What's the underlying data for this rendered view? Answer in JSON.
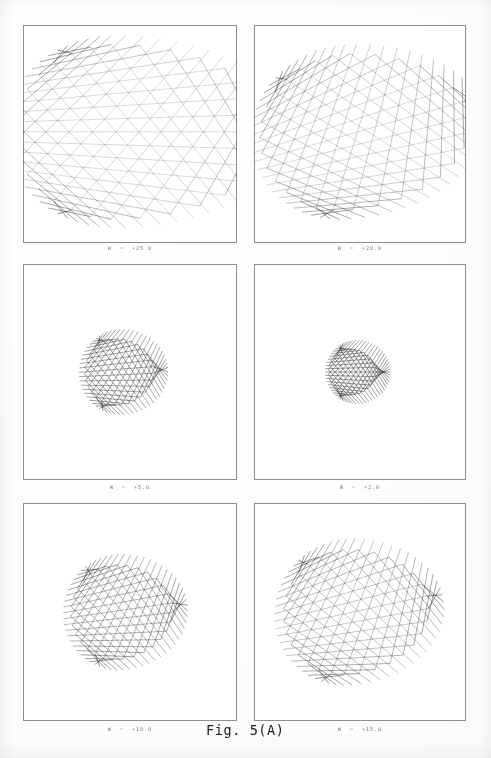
{
  "figure": {
    "caption": "Fig. 5(A)",
    "caption_x": 206,
    "caption_y": 722
  },
  "chart_data": {
    "type": "line",
    "title": "Fig. 5(A)",
    "xlabel": "",
    "ylabel": "",
    "grid": false,
    "legend": null,
    "panel_layout": {
      "rows": 3,
      "cols": 2
    },
    "ray_count_per_panel": 62,
    "panels": [
      {
        "index": 0,
        "label": "W  =  +25.0",
        "parameter_name": "W",
        "parameter_value": 25.0,
        "row": 0,
        "col": 0,
        "box": {
          "x": 23,
          "y": 25,
          "w": 214,
          "h": 218
        },
        "label_y": 245,
        "caustic": "three-cusped deltoid, wide open to the right, dense spine at left",
        "cusp_count": 3,
        "center": {
          "x": 0.44,
          "y": 0.49
        },
        "spread": 1.0,
        "twist": 0.0,
        "stretch": 1.62,
        "focus": 0.3
      },
      {
        "index": 1,
        "label": "W  =  +20.0",
        "parameter_name": "W",
        "parameter_value": 20.0,
        "row": 0,
        "col": 1,
        "box": {
          "x": 254,
          "y": 25,
          "w": 212,
          "h": 218
        },
        "label_y": 245,
        "caustic": "three-cusped caustic, arms rotated and swept clockwise, dense blob at left",
        "cusp_count": 3,
        "center": {
          "x": 0.44,
          "y": 0.49
        },
        "spread": 0.92,
        "twist": -0.3,
        "stretch": 1.4,
        "focus": 0.34
      },
      {
        "index": 2,
        "label": "W  =  +5.0",
        "parameter_name": "W",
        "parameter_value": 5.0,
        "row": 1,
        "col": 0,
        "box": {
          "x": 23,
          "y": 264,
          "w": 214,
          "h": 216
        },
        "label_y": 484,
        "caustic": "lens / vesica shaped envelope, tight focal line left of center",
        "cusp_count": 2,
        "center": {
          "x": 0.47,
          "y": 0.5
        },
        "spread": 0.52,
        "twist": -0.05,
        "stretch": 0.72,
        "focus": 0.7
      },
      {
        "index": 3,
        "label": "W  =  +2.0",
        "parameter_name": "W",
        "parameter_value": 2.0,
        "row": 1,
        "col": 1,
        "box": {
          "x": 254,
          "y": 264,
          "w": 212,
          "h": 216
        },
        "label_y": 484,
        "caustic": "narrow symmetric lens with single bright point focus at centre",
        "cusp_count": 2,
        "center": {
          "x": 0.5,
          "y": 0.5
        },
        "spread": 0.42,
        "twist": 0.0,
        "stretch": 0.6,
        "focus": 0.86
      },
      {
        "index": 4,
        "label": "W  =  +10.0",
        "parameter_name": "W",
        "parameter_value": 10.0,
        "row": 2,
        "col": 0,
        "box": {
          "x": 23,
          "y": 503,
          "w": 214,
          "h": 218
        },
        "label_y": 726,
        "caustic": "lens envelope with emerging three-pronged cusp at centre",
        "cusp_count": 3,
        "center": {
          "x": 0.46,
          "y": 0.5
        },
        "spread": 0.64,
        "twist": -0.12,
        "stretch": 0.92,
        "focus": 0.58
      },
      {
        "index": 5,
        "label": "W  =  +15.0",
        "parameter_name": "W",
        "parameter_value": 15.0,
        "row": 2,
        "col": 1,
        "box": {
          "x": 254,
          "y": 503,
          "w": 212,
          "h": 218
        },
        "label_y": 726,
        "caustic": "three-pronged caustic with arms opening, intermediate between lens and deltoid",
        "cusp_count": 3,
        "center": {
          "x": 0.45,
          "y": 0.5
        },
        "spread": 0.78,
        "twist": -0.2,
        "stretch": 1.12,
        "focus": 0.46
      }
    ]
  }
}
